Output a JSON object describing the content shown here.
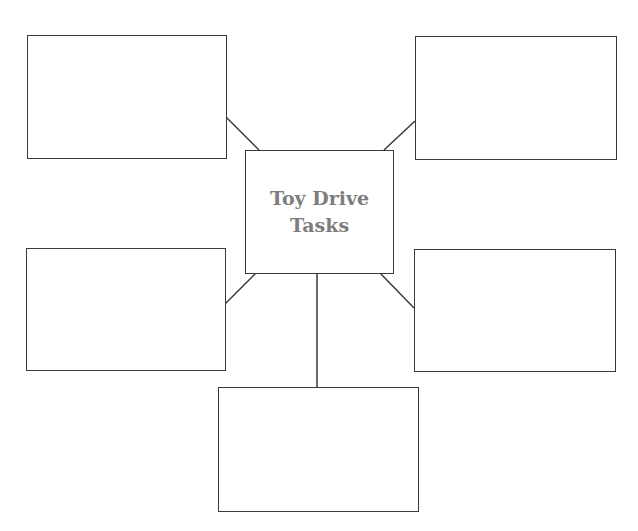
{
  "diagram": {
    "type": "web-organizer",
    "center": {
      "title_line1": "Toy Drive",
      "title_line2": "Tasks"
    },
    "colors": {
      "border": "#3a3a3a",
      "center_text": "#7d7d7d",
      "background": "#ffffff"
    },
    "boxes": [
      {
        "id": "top-left",
        "text": ""
      },
      {
        "id": "top-right",
        "text": ""
      },
      {
        "id": "middle-left",
        "text": ""
      },
      {
        "id": "middle-right",
        "text": ""
      },
      {
        "id": "bottom",
        "text": ""
      }
    ]
  }
}
